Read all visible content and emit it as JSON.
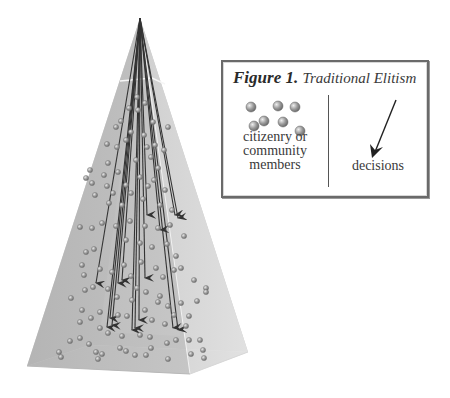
{
  "figure": {
    "label": "Figure 1.",
    "title": "Traditional Elitism",
    "legend": {
      "citizens_label_lines": [
        "citizenry or",
        "community",
        "members"
      ],
      "decisions_label": "decisions",
      "citizens_icon": "sphere-cluster-icon",
      "decisions_icon": "arrow-down-left-icon"
    }
  },
  "colors": {
    "left_face": "#b9b9b9",
    "right_face": "#dcdcdc",
    "base": "#c7c7c7",
    "inner_front": "#cfcfcf",
    "edge_highlight": "#f4f4f4",
    "sphere": "#8c8c8c",
    "arrow": "#333333",
    "box_border": "#6a6a6a"
  },
  "pyramid": {
    "apex": [
      140,
      18
    ],
    "left_bottom": [
      27,
      366
    ],
    "front_bottom": [
      190,
      374
    ],
    "right_bottom": [
      248,
      352
    ],
    "back_bottom": [
      90,
      345
    ],
    "highlight_band_y": 80
  }
}
